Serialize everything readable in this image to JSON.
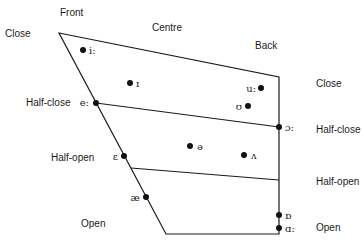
{
  "diagram": {
    "colors": {
      "line": "#1a1a1a",
      "dot": "#111111",
      "text": "#1a1a1a"
    },
    "frontness_labels": [
      {
        "id": "front",
        "text": "Front",
        "x": 60,
        "y": 16
      },
      {
        "id": "centre",
        "text": "Centre",
        "x": 152,
        "y": 31
      },
      {
        "id": "back",
        "text": "Back",
        "x": 255,
        "y": 49
      }
    ],
    "height_labels_left": [
      {
        "id": "close-left",
        "text": "Close",
        "x": 5,
        "y": 37
      },
      {
        "id": "half-close-left",
        "text": "Half-close",
        "x": 26,
        "y": 106
      },
      {
        "id": "half-open-left",
        "text": "Half-open",
        "x": 51,
        "y": 161
      },
      {
        "id": "open-left",
        "text": "Open",
        "x": 81,
        "y": 227
      }
    ],
    "height_labels_right": [
      {
        "id": "close-right",
        "text": "Close",
        "x": 316,
        "y": 87
      },
      {
        "id": "half-close-right",
        "text": "Half-close",
        "x": 316,
        "y": 133
      },
      {
        "id": "half-open-right",
        "text": "Half-open",
        "x": 316,
        "y": 185
      },
      {
        "id": "open-right",
        "text": "Open",
        "x": 316,
        "y": 231
      }
    ],
    "outline": {
      "vertices": [
        {
          "name": "close-front",
          "x": 59,
          "y": 33
        },
        {
          "name": "close-back",
          "x": 279,
          "y": 77
        },
        {
          "name": "open-back",
          "x": 279,
          "y": 234
        },
        {
          "name": "open-front",
          "x": 166,
          "y": 234
        }
      ]
    },
    "grid_lines": [
      {
        "id": "half-close-line",
        "x1": 96,
        "y1": 103,
        "x2": 279,
        "y2": 127
      },
      {
        "id": "half-open-line",
        "x1": 131,
        "y1": 168,
        "x2": 279,
        "y2": 180
      }
    ],
    "vowels": [
      {
        "symbol": "i:",
        "x": 83,
        "y": 50,
        "label_x": 89,
        "label_y": 54,
        "anchor": "start"
      },
      {
        "symbol": "ɪ",
        "x": 130,
        "y": 83,
        "label_x": 136,
        "label_y": 87,
        "anchor": "start"
      },
      {
        "symbol": "e:",
        "x": 96,
        "y": 103,
        "label_x": 89,
        "label_y": 106,
        "anchor": "end"
      },
      {
        "symbol": "ɛ",
        "x": 124,
        "y": 156,
        "label_x": 118,
        "label_y": 160,
        "anchor": "end"
      },
      {
        "symbol": "æ",
        "x": 146,
        "y": 197,
        "label_x": 140,
        "label_y": 201,
        "anchor": "end"
      },
      {
        "symbol": "ə",
        "x": 190,
        "y": 146,
        "label_x": 197,
        "label_y": 150,
        "anchor": "start"
      },
      {
        "symbol": "ʌ",
        "x": 244,
        "y": 155,
        "label_x": 251,
        "label_y": 159,
        "anchor": "start"
      },
      {
        "symbol": "u:",
        "x": 261,
        "y": 88,
        "label_x": 256,
        "label_y": 92,
        "anchor": "end"
      },
      {
        "symbol": "ʊ",
        "x": 248,
        "y": 106,
        "label_x": 242,
        "label_y": 110,
        "anchor": "end"
      },
      {
        "symbol": "ɔ:",
        "x": 279,
        "y": 127,
        "label_x": 285,
        "label_y": 131,
        "anchor": "start"
      },
      {
        "symbol": "ɒ",
        "x": 279,
        "y": 215,
        "label_x": 285,
        "label_y": 219,
        "anchor": "start"
      },
      {
        "symbol": "ɑ:",
        "x": 279,
        "y": 228,
        "label_x": 285,
        "label_y": 232,
        "anchor": "start"
      }
    ]
  }
}
